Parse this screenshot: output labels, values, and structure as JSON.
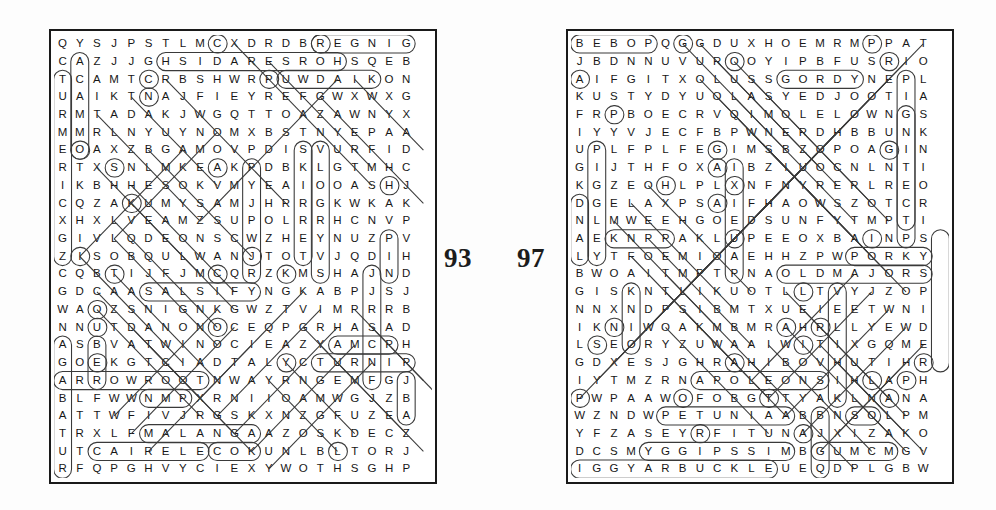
{
  "document": {
    "type": "word-search-puzzle-spread",
    "background_color": "#ffffff",
    "ink_color": "#171717",
    "marking_color": "#3a3a3a"
  },
  "puzzles": [
    {
      "id": "puzzle-left",
      "page_number": "93",
      "columns": 22,
      "rows": 25,
      "rows_text": [
        "QYSJPSTLMCXDRDBREGNIG",
        "CAZJJGHSIDARESROHSQEB",
        "TCAMTCRBSHWRPUWDAIKON",
        "UAIKTNAJFIEYREFGWXWXG",
        "RMTADAKJWGQTTOAZAWNYX",
        "MMRLNYUYNOMXBSTNYEPAA",
        "EOAXZBGAMOVPDISVURFID",
        "RTXSNLMKEAKPDBKLGTMHC",
        "IKBHHESOKVMYEAIOOASHJ",
        "CQZAKUMYSAMJHRRGKWKAK",
        "XHXLVEAMZSUPOLRRHCNVP",
        "GIVLQDEONSCWZHEYNUZPV",
        "ZISOBQULWANJTOTVJQDIH",
        "CQBTIJFJMCQRZKMSHAJND",
        "GDCAASALSIFYNGKABPJSJ",
        "WAOZSNIGNKGWZTVIMPRRB",
        "NNUTDANONOCEQPGRHASAD",
        "ASBVATWINOCIEAZYAMCPH",
        "GOEKGTCIADTALYCTURNIP",
        "ARROWROOTNWAYRNGEMFGJ",
        "BLFWWNMPXRNIIOAMWGJZB",
        "ATTWFIVJRGSKXNZGFUZEA",
        "TRXLFMALANGAAZOSKDECZ",
        "UTCAIRELECOKUNLBLTORJ",
        "RFQPGHVYCIEXYWOTHSGHP"
      ]
    },
    {
      "id": "puzzle-right",
      "page_number": "97",
      "columns": 22,
      "rows": 25,
      "rows_text": [
        "BEBOPQGGDUXHOEMRMPPAT",
        "JBDNNUVUROOYIPBFUSRIO",
        "AIFGITXOLUSSGORDYNEPL",
        "KUSTYDYUOLASYEDJOOTIA",
        "FRPBOECRVQIMOLELOWNGS",
        "IYYVJECFBPWNERDHBBUNK",
        "UPLFPLFEGIMSBZOPOAGIN",
        "GIJTHFOXAIBZIUOCNLNTI",
        "KGZEOHLPLXNFNYRERLREO",
        "DGELAXPSAIFHAOWSZOTCR",
        "NLMWEEHGOEDSUNFYTMPTI",
        "AEKNPPAKLUPEEOXBAINPS",
        "LYTFOEMIOAEHHZPWPORKY",
        "BWOAITMPTPNAOLDMAJORS",
        "GISKNTLIKUOTLLTVYJZOP",
        "NNXNDPSIBMTXUEIEETWNI",
        "IKNIWOAKMBMRAHRLLYEWD",
        "LSEORYZUWAAIWITIXGQME",
        "GDXESJGHRAHIBOVHUTIHR",
        "IYTMZRNAPOLEONSIHLAPH",
        "PWPAAWOFOBGTTYAKLNANA",
        "WZNDWPETUNIAABBNSOLPM",
        "YFZASEYRFITUNAJXIZAKO",
        "DCSMYGGIPSSIMBGUMCMGV",
        "IGGYARBUCKLEUEQDPLGBW"
      ]
    }
  ],
  "found_words": {
    "puzzle_left": [
      "GINGER",
      "HORSERADISH",
      "DAIKON",
      "SALSIFY",
      "YAM",
      "TURNIP",
      "ARROWROOT",
      "MALANGA",
      "CELERIAC"
    ],
    "puzzle_right": [
      "BEBOP",
      "GORDY",
      "PORKY",
      "OLD MAJOR",
      "NAPOLEON",
      "PETUNIA",
      "MISS PIGGY",
      "GUMCM",
      "ARBUCKLE"
    ]
  }
}
